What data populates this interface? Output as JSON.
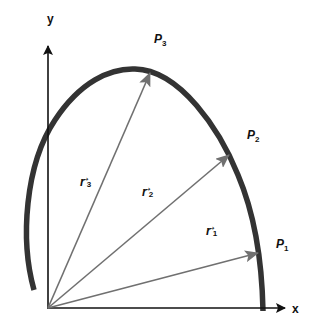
{
  "diagram": {
    "axes": {
      "x_label": "x",
      "y_label": "y"
    },
    "points": [
      {
        "name": "P",
        "sub": "1"
      },
      {
        "name": "P",
        "sub": "2"
      },
      {
        "name": "P",
        "sub": "3"
      }
    ],
    "vectors": [
      {
        "name": "r",
        "sub": "1",
        "arrow": "→"
      },
      {
        "name": "r",
        "sub": "2",
        "arrow": "→"
      },
      {
        "name": "r",
        "sub": "3",
        "arrow": "→"
      }
    ],
    "colors": {
      "curve": "#333333",
      "vectors": "#707070",
      "axes": "#111111"
    }
  }
}
